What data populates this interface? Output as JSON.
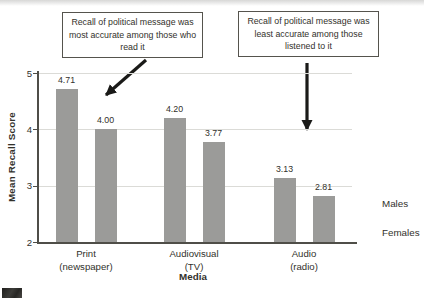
{
  "chart_data": {
    "type": "bar",
    "title": "",
    "categories": [
      {
        "label": "Print",
        "sublabel": "(newspaper)"
      },
      {
        "label": "Audiovisual",
        "sublabel": "(TV)"
      },
      {
        "label": "Audio",
        "sublabel": "(radio)"
      }
    ],
    "series": [
      {
        "name": "Males",
        "values": [
          4.71,
          4.2,
          3.13
        ]
      },
      {
        "name": "Females",
        "values": [
          4.0,
          3.77,
          2.81
        ]
      }
    ],
    "xlabel": "Media",
    "ylabel": "Mean Recall Score",
    "ylim": [
      2,
      5
    ],
    "yticks": [
      5,
      4,
      3,
      2
    ],
    "grid": true,
    "gridline_ticks": [
      5,
      4,
      3
    ],
    "legend_position": "right-middle",
    "value_label_decimals": 2
  },
  "annotations": [
    {
      "text": "Recall of political message was most accurate among those who read it",
      "arrow": "diagonal-down-left"
    },
    {
      "text": "Recall of political message was least accurate among those listened to it",
      "arrow": "vertical-down"
    }
  ],
  "colors": {
    "bar": "#9b9b99",
    "gridline": "#dbdbd7",
    "axis": "#4f4e48",
    "text": "#32312b",
    "arrow": "#1a1a18"
  }
}
